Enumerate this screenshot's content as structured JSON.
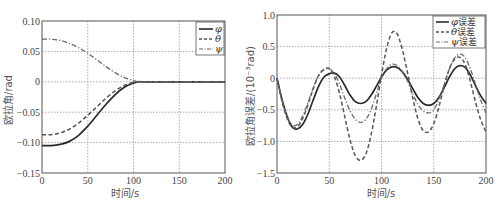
{
  "chart_data": [
    {
      "type": "line",
      "title": "",
      "xlabel": "时间/s",
      "ylabel": "欧拉角/rad",
      "xlim": [
        0,
        200
      ],
      "ylim": [
        -0.15,
        0.1
      ],
      "xticks": [
        "0",
        "50",
        "100",
        "150",
        "200"
      ],
      "yticks": [
        "0.10",
        "0.05",
        "0",
        "-0.05",
        "-0.10",
        "-0.15"
      ],
      "grid": true,
      "legend_position": "upper right",
      "x": [
        0,
        10,
        20,
        30,
        40,
        50,
        60,
        70,
        80,
        90,
        100,
        105,
        110,
        120,
        150,
        200
      ],
      "series": [
        {
          "name": "φ",
          "style": "solid",
          "values": [
            -0.105,
            -0.105,
            -0.103,
            -0.098,
            -0.088,
            -0.073,
            -0.055,
            -0.037,
            -0.021,
            -0.009,
            -0.002,
            0.0,
            0.0,
            0.0,
            0.0,
            0.0
          ]
        },
        {
          "name": "θ",
          "style": "dashed",
          "values": [
            -0.087,
            -0.087,
            -0.084,
            -0.078,
            -0.068,
            -0.055,
            -0.041,
            -0.027,
            -0.015,
            -0.006,
            -0.001,
            0.0,
            0.0,
            0.0,
            0.0,
            0.0
          ]
        },
        {
          "name": "ψ",
          "style": "dashdot",
          "values": [
            0.07,
            0.07,
            0.068,
            0.063,
            0.056,
            0.047,
            0.036,
            0.025,
            0.015,
            0.007,
            0.002,
            0.0,
            0.0,
            0.0,
            0.0,
            0.0
          ]
        }
      ]
    },
    {
      "type": "line",
      "title": "",
      "xlabel": "时间/s",
      "ylabel": "欧拉角误差/(10⁻³rad)",
      "xlim": [
        0,
        200
      ],
      "ylim": [
        -1.5,
        1.0
      ],
      "xticks": [
        "0",
        "50",
        "100",
        "150",
        "200"
      ],
      "yticks": [
        "1.0",
        "0.5",
        "0",
        "-0.5",
        "-1.0",
        "-1.5"
      ],
      "grid": true,
      "legend_position": "upper right",
      "x": [
        0,
        5,
        10,
        15,
        20,
        25,
        30,
        35,
        40,
        45,
        50,
        55,
        60,
        65,
        70,
        75,
        80,
        85,
        90,
        95,
        100,
        105,
        110,
        115,
        120,
        125,
        130,
        135,
        140,
        145,
        150,
        155,
        160,
        165,
        170,
        175,
        180,
        185,
        190,
        195,
        200
      ],
      "series": [
        {
          "name": "φ误差",
          "style": "solid",
          "values": [
            0.0,
            -0.35,
            -0.62,
            -0.78,
            -0.8,
            -0.72,
            -0.55,
            -0.33,
            -0.12,
            0.02,
            0.07,
            0.08,
            0.02,
            -0.12,
            -0.27,
            -0.37,
            -0.4,
            -0.37,
            -0.27,
            -0.13,
            0.02,
            0.13,
            0.18,
            0.17,
            0.1,
            -0.02,
            -0.17,
            -0.31,
            -0.4,
            -0.43,
            -0.4,
            -0.3,
            -0.15,
            0.02,
            0.15,
            0.2,
            0.17,
            0.05,
            -0.12,
            -0.28,
            -0.4
          ]
        },
        {
          "name": "θ误差",
          "style": "dashed",
          "values": [
            0.0,
            -0.38,
            -0.65,
            -0.78,
            -0.76,
            -0.62,
            -0.4,
            -0.15,
            0.05,
            0.14,
            0.15,
            0.02,
            -0.25,
            -0.62,
            -0.98,
            -1.23,
            -1.3,
            -1.2,
            -0.9,
            -0.45,
            0.05,
            0.48,
            0.72,
            0.7,
            0.45,
            0.08,
            -0.32,
            -0.65,
            -0.83,
            -0.85,
            -0.72,
            -0.45,
            -0.12,
            0.15,
            0.3,
            0.33,
            0.22,
            -0.05,
            -0.38,
            -0.66,
            -0.85
          ]
        },
        {
          "name": "ψ误差",
          "style": "dashdot",
          "values": [
            0.0,
            -0.36,
            -0.62,
            -0.75,
            -0.72,
            -0.58,
            -0.37,
            -0.14,
            0.05,
            0.13,
            0.15,
            0.07,
            -0.1,
            -0.32,
            -0.52,
            -0.65,
            -0.7,
            -0.65,
            -0.5,
            -0.25,
            0.02,
            0.15,
            0.22,
            0.2,
            0.1,
            -0.05,
            -0.25,
            -0.42,
            -0.52,
            -0.55,
            -0.5,
            -0.33,
            -0.1,
            0.15,
            0.32,
            0.38,
            0.33,
            0.15,
            -0.1,
            -0.35,
            -0.55
          ]
        }
      ]
    }
  ],
  "left_chart": {
    "ylabel": "欧拉角/rad",
    "xlabel": "时间/s",
    "legend": [
      "φ",
      "θ",
      "ψ"
    ]
  },
  "right_chart": {
    "ylabel": "欧拉角误差/(10⁻³rad)",
    "xlabel": "时间/s",
    "legend": [
      {
        "sym": "φ",
        "text": "误差"
      },
      {
        "sym": "θ",
        "text": "误差"
      },
      {
        "sym": "ψ",
        "text": "误差"
      }
    ]
  },
  "colors": {
    "phi": "#2a2a2a",
    "theta": "#555555",
    "psi": "#6a6a6a",
    "grid": "#888888",
    "axis": "#555555"
  }
}
